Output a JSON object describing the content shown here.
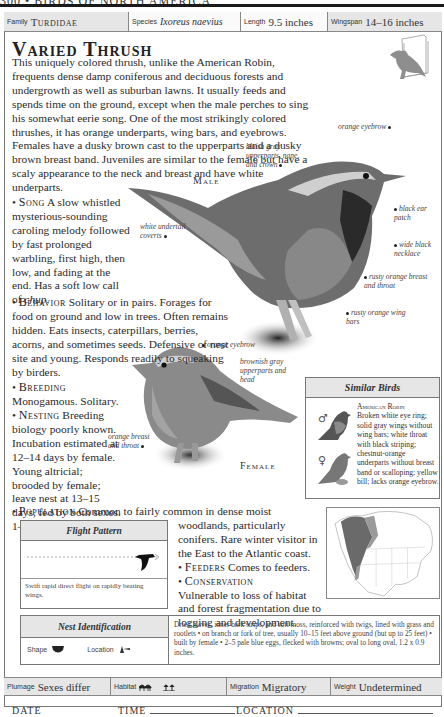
{
  "running_head": "300 • BIRDS OF NORTH AMERICA",
  "info_bar": {
    "family_label": "Family",
    "family_value": "Turdidae",
    "species_label": "Species",
    "species_value": "Ixoreus naevius",
    "length_label": "Length",
    "length_value": "9.5 inches",
    "wingspan_label": "Wingspan",
    "wingspan_value": "14–16 inches"
  },
  "title": "Varied Thrush",
  "intro": "This uniquely colored thrush, unlike the American Robin, frequents dense damp coniferous and deciduous forests and undergrowth as well as suburban lawns. It usually feeds and spends time on the ground, except when the male perches to sing his somewhat eerie song. One of the most strikingly colored thrushes, it has orange underparts, wing bars, and eyebrows. Females have a dusky brown cast to the upperparts and a dusky brown breast band. Juveniles are similar to the female but have a scaly appearance to the neck and breast and have white underparts.",
  "sections": {
    "song": {
      "heading": "Song",
      "text": "A slow whistled mysterious-sounding caroling melody followed by fast prolonged warbling, first high, then low, and fading at the end. Has a soft low call of ",
      "call": "chup",
      "end": "."
    },
    "behavior": {
      "heading": "Behavior",
      "text": "Solitary or in pairs. Forages for food on ground and low in trees. Often remains hidden. Eats insects, caterpillars, berries, acorns, and sometimes seeds. Defensive of nest site and young. Responds readily to squeaking by birders."
    },
    "breeding": {
      "heading": "Breeding",
      "text": "Monogamous. Solitary."
    },
    "nesting": {
      "heading": "Nesting",
      "text": "Breeding biology poorly known. Incubation estimated at 12–14 days by female. Young altricial; brooded by female; leave nest at 13–15 days, fed by both sexes. 1–2 broods per year."
    },
    "population": {
      "heading": "Population",
      "text1": "Common to fairly common in dense moist",
      "text2": "woodlands, particularly conifers. Rare winter visitor in the East to the Atlantic coast."
    },
    "feeders": {
      "heading": "Feeders",
      "text": "Comes to feeders."
    },
    "conservation": {
      "heading": "Conservation",
      "text": "Vulnerable to loss of habitat and forest fragmentation due to logging and development."
    }
  },
  "male": {
    "label": "Male",
    "annotations": {
      "orange_eyebrow": "orange eyebrow",
      "bluish_gray": "bluish gray upperparts, nape, and crown",
      "black_ear": "black ear patch",
      "white_undertail": "white undertail coverts",
      "wide_necklace": "wide black necklace",
      "rusty_breast": "rusty orange breast and throat",
      "rusty_wing": "rusty orange wing bars"
    }
  },
  "female": {
    "label": "Female",
    "annotations": {
      "orange_eyebrow": "orange eyebrow",
      "brownish_gray": "brownish gray upperparts and head",
      "orange_breast": "orange breast and throat"
    }
  },
  "similar_birds": {
    "heading": "Similar Birds",
    "name": "American Robin",
    "description": "Broken white eye ring; solid gray wings without wing bars; white throat with black striping; chestnut-orange underparts without breast band or scalloping; yellow bill; lacks orange eyebrow.",
    "male_symbol": "♂",
    "female_symbol": "♀"
  },
  "flight_pattern": {
    "heading": "Flight Pattern",
    "description": "Swift rapid direct flight on rapidly beating wings."
  },
  "nest_identification": {
    "heading": "Nest Identification",
    "shape_label": "Shape",
    "location_label": "Location",
    "description": "Dried leaves, inner bark strips, and soft moss, reinforced with twigs, lined with grass and rootlets • on branch or fork of tree, usually 10–15 feet above ground (but up to 25 feet) • built by female • 2–5 pale blue eggs, flecked with browns; oval to long oval, 1.2 x 0.9 inches."
  },
  "bottom_bar": {
    "plumage_label": "Plumage",
    "plumage_value": "Sexes differ",
    "habitat_label": "Habitat",
    "migration_label": "Migration",
    "migration_value": "Migratory",
    "weight_label": "Weight",
    "weight_value": "Undetermined"
  },
  "log": {
    "date": "DATE",
    "time": "TIME",
    "location": "LOCATION"
  },
  "colors": {
    "panel_gray": "#e6e6e6",
    "range_dark": "#6a6a6a",
    "range_mid": "#9a9a9a"
  }
}
